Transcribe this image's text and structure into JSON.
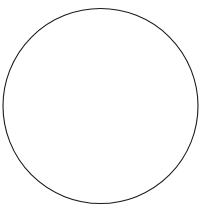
{
  "figure": {
    "kind": "geometry-diagram",
    "canvas": {
      "width": 205,
      "height": 213,
      "background_color": "#ffffff"
    },
    "shapes": [
      {
        "id": "circle-outline",
        "name": "circle",
        "type": "circle",
        "center_x": 100.5,
        "center_y": 106,
        "radius": 97.5,
        "stroke_color": "#1a1a1a",
        "stroke_width": 1.1,
        "fill": "none"
      },
      {
        "id": "radius-segment",
        "name": "radius-line",
        "type": "line",
        "x1": 105,
        "y1": 107,
        "x2": 31,
        "y2": 178,
        "stroke_color": "#1a1a1a",
        "stroke_width": 1.2
      }
    ],
    "labels": []
  }
}
